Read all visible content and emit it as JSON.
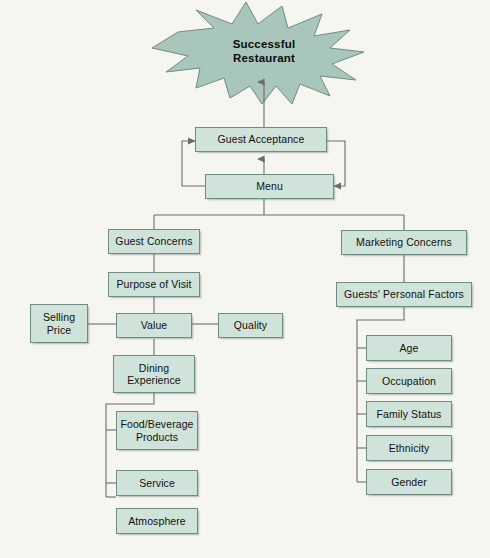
{
  "diagram": {
    "title_shape": {
      "name": "starburst",
      "label_line1": "Successful",
      "label_line2": "Restaurant",
      "fill": "#a9c6bc",
      "stroke": "#6f8b83"
    },
    "palette": {
      "background": "#f6f6f1",
      "box_fill": "#cfe3da",
      "box_stroke": "#6f8b83",
      "line": "#6b6b6b",
      "text": "#101010"
    },
    "nodes": {
      "guest_acceptance": "Guest Acceptance",
      "menu": "Menu",
      "guest_concerns": "Guest Concerns",
      "purpose_of_visit": "Purpose of Visit",
      "selling_price_line1": "Selling",
      "selling_price_line2": "Price",
      "value": "Value",
      "quality": "Quality",
      "dining_experience_line1": "Dining",
      "dining_experience_line2": "Experience",
      "food_beverage_line1": "Food/Beverage",
      "food_beverage_line2": "Products",
      "service": "Service",
      "atmosphere": "Atmosphere",
      "marketing_concerns": "Marketing Concerns",
      "guests_personal_factors": "Guests' Personal Factors",
      "age": "Age",
      "occupation": "Occupation",
      "family_status": "Family Status",
      "ethnicity": "Ethnicity",
      "gender": "Gender"
    }
  }
}
